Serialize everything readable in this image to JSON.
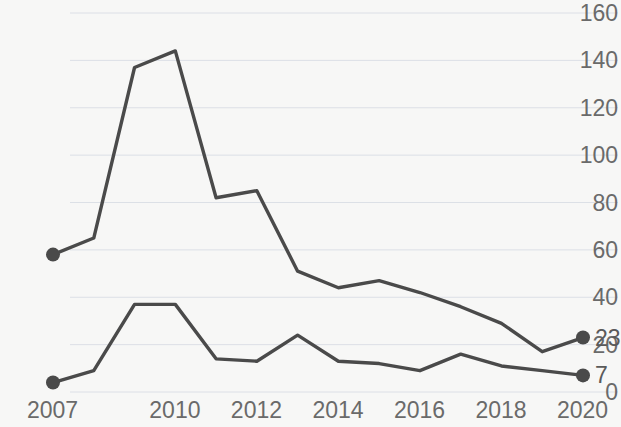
{
  "chart_data": {
    "type": "line",
    "title": "",
    "subtitle": "",
    "xlabel": "",
    "ylabel": "",
    "grid": "horizontal",
    "legend_position": "none",
    "background_color": "#f7f7f6",
    "line_color": "#4a4a4a",
    "marker_color": "#4a4a4a",
    "gridline_color": "#d8dce4",
    "tick_label_color": "#6a6a6a",
    "x": [
      2007,
      2008,
      2009,
      2010,
      2011,
      2012,
      2013,
      2014,
      2015,
      2016,
      2017,
      2018,
      2019,
      2020
    ],
    "xlim": [
      2007,
      2020
    ],
    "ylim": [
      0,
      160
    ],
    "y_ticks": [
      0,
      20,
      40,
      60,
      80,
      100,
      120,
      140,
      160
    ],
    "y_tick_labels": [
      "0",
      "20",
      "40",
      "60",
      "80",
      "100",
      "120",
      "140",
      "160"
    ],
    "x_ticks": [
      2007,
      2010,
      2012,
      2014,
      2016,
      2018,
      2020
    ],
    "x_tick_labels": [
      "2007",
      "2010",
      "2012",
      "2014",
      "2016",
      "2018",
      "2020"
    ],
    "series": [
      {
        "name": "upper",
        "values": [
          58,
          65,
          137,
          144,
          82,
          85,
          51,
          44,
          47,
          42,
          36,
          29,
          17,
          23
        ],
        "end_label": "23",
        "start_marker": true,
        "end_marker": true
      },
      {
        "name": "lower",
        "values": [
          4,
          9,
          37,
          37,
          14,
          13,
          24,
          13,
          12,
          9,
          16,
          11,
          9,
          7
        ],
        "end_label": "7",
        "start_marker": true,
        "end_marker": true
      }
    ]
  },
  "axes": {
    "y_labels": [
      "160",
      "140",
      "120",
      "100",
      "80",
      "60",
      "40",
      "20",
      "0"
    ],
    "x_labels": [
      "2007",
      "2010",
      "2012",
      "2014",
      "2016",
      "2018",
      "2020"
    ]
  },
  "annotations": {
    "upper_end_value": "23",
    "lower_end_value": "7"
  }
}
